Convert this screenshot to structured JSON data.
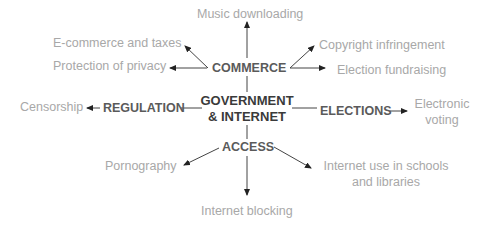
{
  "diagram": {
    "center": {
      "line1": "GOVERNMENT",
      "line2": "& INTERNET"
    },
    "hubs": {
      "commerce": "COMMERCE",
      "regulation": "REGULATION",
      "elections": "ELECTIONS",
      "access": "ACCESS"
    },
    "leaves": {
      "music_downloading": "Music downloading",
      "ecommerce_taxes": "E-commerce and taxes",
      "protection_privacy": "Protection of privacy",
      "copyright": "Copyright infringement",
      "election_fundraising": "Election fundraising",
      "censorship": "Censorship",
      "electronic_voting_1": "Electronic",
      "electronic_voting_2": "voting",
      "pornography": "Pornography",
      "internet_schools_1": "Internet use in schools",
      "internet_schools_2": "and libraries",
      "internet_blocking": "Internet blocking"
    },
    "colors": {
      "leaf": "#a8a8a8",
      "hub": "#5a5a5a",
      "core": "#3a3a3a",
      "line": "#333333"
    }
  }
}
